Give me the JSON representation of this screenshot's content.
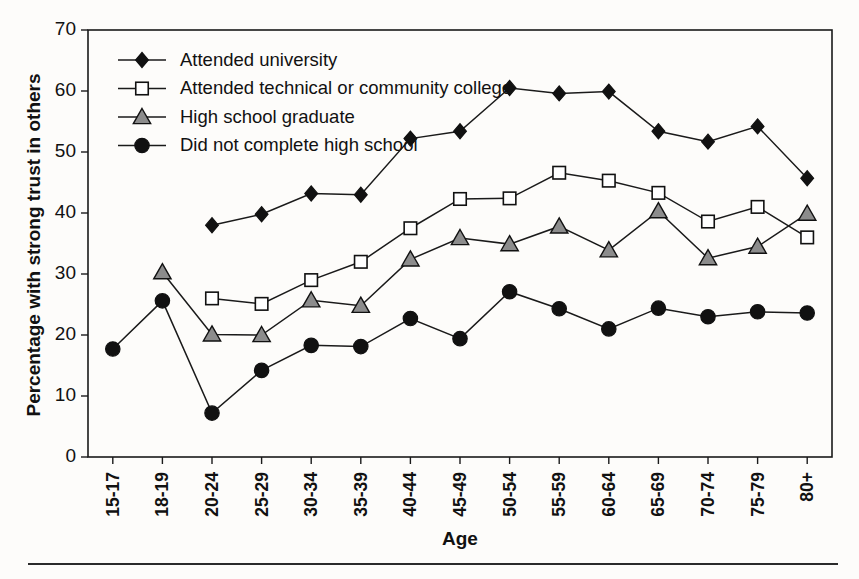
{
  "chart_data": {
    "type": "line",
    "title": "",
    "xlabel": "Age",
    "ylabel": "Percentage with strong trust in others",
    "ylim": [
      0,
      70
    ],
    "yticks": [
      0,
      10,
      20,
      30,
      40,
      50,
      60,
      70
    ],
    "grid": false,
    "legend_position": "top-left inside plot area",
    "categories": [
      "15-17",
      "18-19",
      "20-24",
      "25-29",
      "30-34",
      "35-39",
      "40-44",
      "45-49",
      "50-54",
      "55-59",
      "60-64",
      "65-69",
      "70-74",
      "75-79",
      "80+"
    ],
    "series": [
      {
        "name": "Attended university",
        "marker": "filled-diamond",
        "marker_fill": "#111111",
        "marker_stroke": "#111111",
        "values": [
          null,
          null,
          38.0,
          39.8,
          43.2,
          43.0,
          52.2,
          53.4,
          60.5,
          59.6,
          59.9,
          53.4,
          51.7,
          54.2,
          45.7
        ]
      },
      {
        "name": "Attended technical or community college",
        "marker": "open-square",
        "marker_fill": "#ffffff",
        "marker_stroke": "#111111",
        "values": [
          null,
          null,
          26.0,
          25.1,
          29.0,
          32.0,
          37.5,
          42.3,
          42.4,
          46.6,
          45.3,
          43.3,
          38.6,
          41.0,
          36.0
        ]
      },
      {
        "name": "High school graduate",
        "marker": "filled-triangle",
        "marker_fill": "#8c8c8c",
        "marker_stroke": "#111111",
        "values": [
          null,
          30.3,
          20.1,
          20.0,
          25.7,
          24.8,
          32.4,
          35.9,
          34.9,
          37.8,
          33.9,
          40.3,
          32.6,
          34.5,
          39.9
        ]
      },
      {
        "name": "Did not complete high school",
        "marker": "filled-circle",
        "marker_fill": "#111111",
        "marker_stroke": "#111111",
        "values": [
          17.7,
          25.6,
          7.2,
          14.2,
          18.3,
          18.1,
          22.7,
          19.4,
          27.1,
          24.3,
          21.0,
          24.4,
          23.0,
          23.8,
          23.6
        ]
      }
    ]
  },
  "legend": {
    "items": [
      {
        "label": "Attended university"
      },
      {
        "label": "Attended technical or community college"
      },
      {
        "label": "High school graduate"
      },
      {
        "label": "Did not complete high school"
      }
    ]
  },
  "colors": {
    "axis": "#1a1a1a",
    "line": "#1a1a1a",
    "background": "#fdfcfa",
    "triangle_fill": "#8c8c8c",
    "square_fill": "#ffffff"
  }
}
